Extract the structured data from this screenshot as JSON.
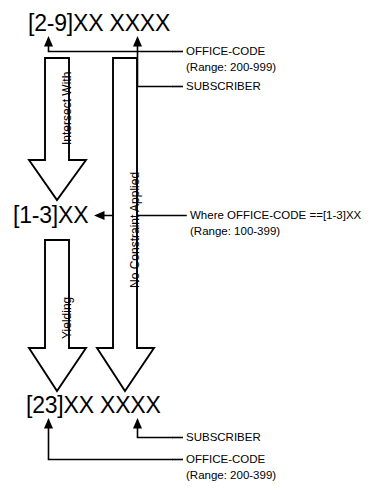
{
  "diagram": {
    "stroke_color": "#000000",
    "fill_color": "#ffffff",
    "background_color": "#ffffff",
    "nodes": {
      "top_pattern": "[2-9]XX XXXX",
      "middle_pattern": "[1-3]XX",
      "bottom_pattern": "[23]XX XXXX"
    },
    "top_annotations": {
      "office_code_label": "OFFICE-CODE",
      "office_code_range": "(Range: 200-999)",
      "subscriber_label": "SUBSCRIBER"
    },
    "middle_annotations": {
      "condition_line": "Where OFFICE-CODE ==[1-3]XX",
      "condition_range": "(Range: 100-399)"
    },
    "bottom_annotations": {
      "subscriber_label": "SUBSCRIBER",
      "office_code_label": "OFFICE-CODE",
      "office_code_range": "(Range: 200-399)"
    },
    "arrows": {
      "left_upper_caption": "Intersect With",
      "left_lower_caption": "Yielding",
      "right_caption": "No Constraint Applied"
    }
  }
}
